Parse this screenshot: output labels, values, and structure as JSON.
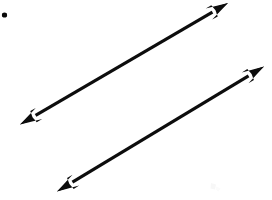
{
  "figure": {
    "title": "Two parallel double-headed arrows",
    "background_color": "#ffffff",
    "ink_color": "#0d0d0d",
    "canvas": {
      "width": 272,
      "height": 200
    },
    "stroke_width": 3.2
  },
  "chart_data": {
    "type": "diagram",
    "title": "Two parallel double-headed arrows",
    "xlabel": "",
    "ylabel": "",
    "xlim": [
      0,
      272
    ],
    "ylim": [
      0,
      200
    ],
    "grid": false,
    "legend": false,
    "annotations": [],
    "elements": [
      {
        "name": "point-dot",
        "kind": "dot",
        "x": 4.5,
        "y": 15.0,
        "radius": 2.6,
        "color": "#0d0d0d"
      },
      {
        "name": "line-upper",
        "kind": "double-headed-arrow",
        "x1": 20.0,
        "y1": 124.5,
        "x2": 228.0,
        "y2": 3.0,
        "slope": -0.584,
        "angle_deg": 30.3,
        "length": 240.9,
        "color": "#0d0d0d",
        "arrowheads": [
          "start",
          "end"
        ]
      },
      {
        "name": "line-lower",
        "kind": "double-headed-arrow",
        "x1": 57.0,
        "y1": 191.5,
        "x2": 264.0,
        "y2": 66.5,
        "slope": -0.604,
        "angle_deg": 31.1,
        "length": 241.8,
        "color": "#0d0d0d",
        "arrowheads": [
          "start",
          "end"
        ]
      },
      {
        "name": "scan-smudge",
        "kind": "artifact",
        "x": 214.0,
        "y": 188.0,
        "color": "#fafafa"
      }
    ]
  },
  "accessibility": {
    "description": "A plain white page showing a small black dot in the upper left corner and two long parallel double-headed arrows running from lower-left to upper-right."
  }
}
